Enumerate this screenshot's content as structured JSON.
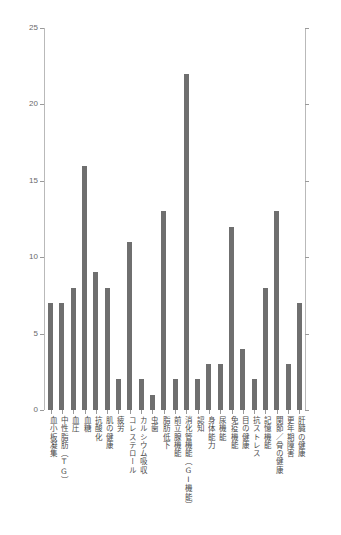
{
  "chart_data": {
    "type": "bar",
    "title": "",
    "subtitle": "",
    "xlabel": "",
    "ylabel": "",
    "ylim": [
      0,
      25
    ],
    "yticks": [
      0,
      5,
      10,
      15,
      20,
      25
    ],
    "ytick_labels": [
      "0",
      "5",
      "10",
      "15",
      "20",
      "25"
    ],
    "grid": false,
    "legend": null,
    "bar_color": "#6f6f6f",
    "axis_color": "#b9b9b9",
    "categories": [
      "血小板凝集",
      "中性脂肪（TG）",
      "血圧",
      "血糖",
      "抗酸化",
      "肌の健康",
      "疲労",
      "コレステロール",
      "カルシウム吸収",
      "虫歯",
      "脂肪低下",
      "前立腺機能",
      "消化管機能（GI機能）",
      "認知",
      "身体能力",
      "尿機能",
      "免疫機能",
      "目の健康",
      "抗ストレス",
      "記憶機能",
      "関節／骨の健康",
      "更年期障害",
      "肝臓の健康"
    ],
    "values": [
      7,
      7,
      8,
      16,
      9,
      8,
      2,
      11,
      2,
      1,
      13,
      2,
      22,
      2,
      3,
      3,
      12,
      4,
      2,
      8,
      13,
      3,
      7
    ]
  }
}
